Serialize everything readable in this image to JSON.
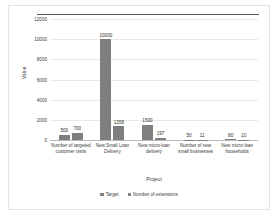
{
  "chart_data": {
    "type": "bar",
    "title": "",
    "xlabel": "Project",
    "ylabel": "Value",
    "ylim": [
      0,
      12000
    ],
    "yticks": [
      0,
      2000,
      4000,
      6000,
      8000,
      10000,
      12000
    ],
    "ytick_labels": [
      "0",
      "2000",
      "4000",
      "6000",
      "8000",
      "10000",
      "12000"
    ],
    "grid": true,
    "legend_position": "bottom",
    "categories": [
      "Number of targeted customer visits",
      "New Small Loan Delivery",
      "New micro-loan delivery",
      "Number of new small businesses",
      "New micro-loan households"
    ],
    "series": [
      {
        "name": "Target",
        "color": "#7f7f7f",
        "values": [
          500,
          10000,
          1500,
          50,
          80
        ],
        "value_labels": [
          "500",
          "10000",
          "1500",
          "50",
          "80"
        ]
      },
      {
        "name": "Number of extensions",
        "color": "#7f7f7f",
        "values": [
          700,
          1358,
          197,
          11,
          10
        ],
        "value_labels": [
          "700",
          "1358",
          "197",
          "11",
          "10"
        ]
      }
    ]
  },
  "colors": {
    "bar": "#7f7f7f",
    "frame": "#e2e2e2",
    "grid": "#e8e8e8",
    "axis": "#b9b9b9",
    "text": "#3a3a3a"
  }
}
